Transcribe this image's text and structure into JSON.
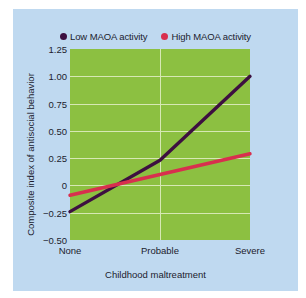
{
  "chart_data": {
    "type": "line",
    "title": "",
    "xlabel": "Childhood maltreatment",
    "ylabel": "Composite index of antisocial behavior",
    "categories": [
      "None",
      "Probable",
      "Severe"
    ],
    "x": [
      0,
      1,
      2
    ],
    "xlim": [
      0,
      2
    ],
    "ylim": [
      -0.5,
      1.25
    ],
    "yticks": [
      "1.25",
      "1.00",
      "0.75",
      "0.50",
      "0.25",
      "0",
      "-0.25",
      "-0.50"
    ],
    "ytick_values": [
      1.25,
      1.0,
      0.75,
      0.5,
      0.25,
      0,
      -0.25,
      -0.5
    ],
    "grid": true,
    "legend_position": "top-center",
    "plot_background": "#8cc041",
    "gridline_color": "#d6e8b4",
    "series": [
      {
        "name": "Low MAOA activity",
        "color": "#3d1040",
        "values": [
          -0.24,
          0.23,
          1.0
        ]
      },
      {
        "name": "High MAOA activity",
        "color": "#d82f4e",
        "values": [
          -0.09,
          0.1,
          0.29
        ]
      }
    ]
  },
  "legend": {
    "entries": [
      {
        "label": "Low MAOA activity",
        "color": "#3d1040",
        "marker": "circle-marker"
      },
      {
        "label": "High MAOA activity",
        "color": "#d82f4e",
        "marker": "circle-marker"
      }
    ]
  },
  "axes": {
    "y_title": "Composite index of antisocial behavior",
    "x_title": "Childhood maltreatment",
    "y_tick_labels": [
      "1.25",
      "1.00",
      "0.75",
      "0.50",
      "0.25",
      "0",
      "−0.25",
      "−0.50"
    ],
    "x_tick_labels": [
      "None",
      "Probable",
      "Severe"
    ]
  },
  "colors": {
    "card_background": "#bfd9f0",
    "page_background": "#ffffff",
    "text": "#1c1c2e",
    "plot_background": "#8cc041",
    "gridlines": "#d6e8b4",
    "series_low": "#3d1040",
    "series_high": "#d82f4e"
  }
}
